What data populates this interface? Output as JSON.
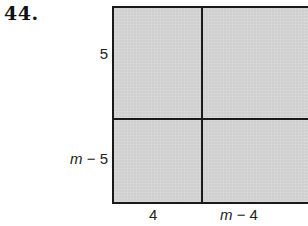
{
  "problem": {
    "number": "44."
  },
  "figure": {
    "type": "area-model-rectangle",
    "fill_color": "#d3d3d3",
    "border_color": "#1a1a1a",
    "rows": 2,
    "columns": 2,
    "left_labels": [
      {
        "text": "5"
      },
      {
        "var": "m",
        "rest": " − 5"
      }
    ],
    "bottom_labels": [
      {
        "text": "4"
      },
      {
        "var": "m",
        "rest": " − 4"
      }
    ],
    "regions": [
      {
        "row": 1,
        "col": 1,
        "height_label": "5",
        "width_label": "4"
      },
      {
        "row": 1,
        "col": 2,
        "height_label": "5",
        "width_label": "m − 4"
      },
      {
        "row": 2,
        "col": 1,
        "height_label": "m − 5",
        "width_label": "4"
      },
      {
        "row": 2,
        "col": 2,
        "height_label": "m − 5",
        "width_label": "m − 4"
      }
    ]
  }
}
